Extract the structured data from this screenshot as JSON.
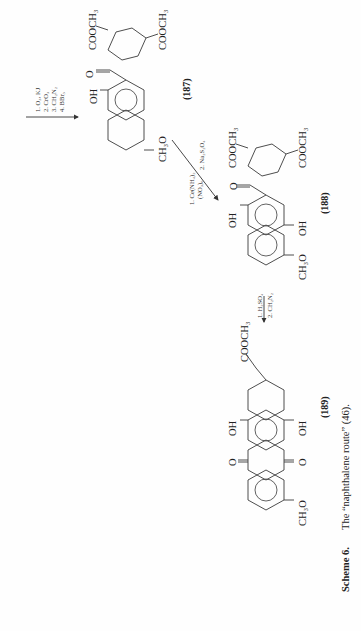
{
  "page": {
    "orientation": "rotated-90-ccw",
    "background": "#fefefe",
    "ink_color": "#222222"
  },
  "scheme": {
    "caption": {
      "label": "Scheme 6.",
      "text": "The “naphthalene route” (46)."
    },
    "steps": [
      {
        "reagents": [
          "1. O₃, KJ",
          "2. CrO₃",
          "3. CH₂N₂",
          "4. BBr₃"
        ]
      },
      {
        "reagents": [
          "1. Ce(NH₄)₂",
          "(NO₃)₆",
          "2. Na₂S₂O₄"
        ]
      },
      {
        "reagents": [
          "1. H₂SO₄",
          "2. CH₂N₂"
        ]
      }
    ],
    "compounds": [
      {
        "id": "(187)",
        "groups": {
          "oh": "OH",
          "ketone_o": "O",
          "methoxy": "CH₃O",
          "ester_1": "COOCH₃",
          "ester_2": "COOCH₃"
        }
      },
      {
        "id": "(188)",
        "groups": {
          "oh_1": "OH",
          "oh_2": "OH",
          "ketone_o": "O",
          "methoxy": "CH₃O",
          "ester_1": "COOCH₃",
          "ester_2": "COOCH₃"
        }
      },
      {
        "id": "(189)",
        "groups": {
          "oh_1": "OH",
          "oh_2": "OH",
          "quinone_o_1": "O",
          "quinone_o_2": "O",
          "methoxy": "CH₃O",
          "ester": "COOCH₃"
        }
      }
    ]
  }
}
